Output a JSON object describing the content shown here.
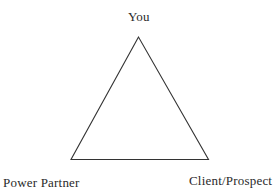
{
  "diagram": {
    "type": "triangle-relationship",
    "nodes": {
      "top": {
        "label": "You"
      },
      "bottom_left": {
        "label": "Power Partner"
      },
      "bottom_right": {
        "label": "Client/Prospect"
      }
    },
    "edges": [
      {
        "from": "You",
        "to": "Power Partner"
      },
      {
        "from": "You",
        "to": "Client/Prospect"
      },
      {
        "from": "Power Partner",
        "to": "Client/Prospect"
      }
    ],
    "colors": {
      "line": "#333333",
      "text": "#2a2a2a",
      "background": "#ffffff"
    }
  }
}
